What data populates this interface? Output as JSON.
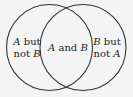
{
  "diagram": {
    "type": "venn",
    "sets": [
      "A",
      "B"
    ],
    "regions": {
      "left": {
        "line1": "A but",
        "line2": "not B"
      },
      "center": {
        "line1": "A and B"
      },
      "right": {
        "line1": "B but",
        "line2": "not A"
      }
    },
    "colors": {
      "stroke": "#333333",
      "background": "#f4f4f4",
      "text": "#222222"
    }
  }
}
